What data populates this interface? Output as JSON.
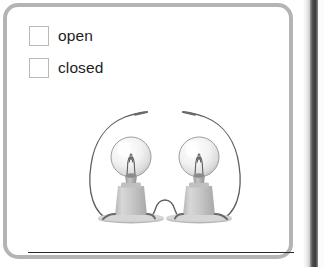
{
  "page": {
    "background_color": "#ffffff",
    "box_border_color": "#b4b4b4"
  },
  "question": {
    "options": [
      {
        "id": "open",
        "label": "open",
        "checked": false,
        "icon": "checkbox-empty-icon"
      },
      {
        "id": "closed",
        "label": "closed",
        "checked": false,
        "icon": "checkbox-empty-icon"
      }
    ],
    "answer_line": {
      "visible": true,
      "color": "#2b2b2b"
    }
  },
  "illustration": {
    "name": "two-light-bulbs-circuit",
    "description": "Two light bulbs in sockets connected by a wire at their bases, with two wires curving upward whose free ends do not touch",
    "circuit_state": "open",
    "bulbs": [
      {
        "id": "left-bulb",
        "lit": false
      },
      {
        "id": "right-bulb",
        "lit": false
      }
    ],
    "wires": [
      {
        "id": "left-wire",
        "path": "from left bulb base curving up and to the right"
      },
      {
        "id": "right-wire",
        "path": "from right bulb base curving up and to the left"
      },
      {
        "id": "center-wire",
        "path": "short arch between the two bulb bases"
      }
    ],
    "colors": {
      "wire": "#5a5a5a",
      "socket": "#c3c3c3",
      "socket_shadow": "#a5a5a5",
      "glass": "#ececec",
      "filament": "#4a4a4a",
      "base_plate": "#cfcfcf"
    }
  },
  "scan_edge": {
    "dark_strip_color": "#3d3d3d",
    "light_strip_color": "#fbfbfb"
  }
}
